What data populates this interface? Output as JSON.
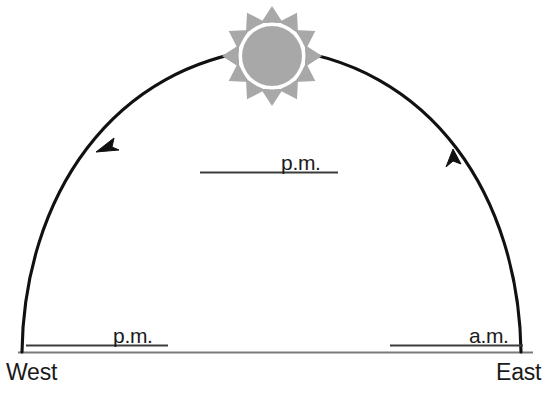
{
  "diagram": {
    "type": "sun-path-arc",
    "background_color": "#ffffff",
    "arc_color": "#111111",
    "horizon_color": "#777777",
    "rule_color": "#444444",
    "sun": {
      "icon": "sun-icon",
      "disc_color": "#a8a8a8",
      "ray_color": "#a8a8a8",
      "ring_color": "#ffffff",
      "ray_count": 12,
      "center_x": 272,
      "center_y": 56,
      "disc_radius": 30,
      "ray_outer_radius": 48
    },
    "arc": {
      "left_end_x": 22,
      "left_end_y": 352,
      "right_end_x": 521,
      "right_end_y": 352,
      "apex_x": 272,
      "apex_y": 48,
      "direction": "east-to-west",
      "arrowheads": [
        {
          "name": "arrow-descending-west",
          "x": 100,
          "y": 147,
          "points": "down-left"
        },
        {
          "name": "arrow-ascending-east",
          "x": 455,
          "y": 155,
          "points": "up-left"
        }
      ]
    },
    "horizon": {
      "x_start": 18,
      "x_end": 533,
      "y": 352
    },
    "labels": {
      "pm_upper": {
        "text": "p.m.",
        "rule_x1": 200,
        "rule_x2": 338,
        "rule_y": 172
      },
      "pm_lower": {
        "text": "p.m.",
        "rule_x1": 26,
        "rule_x2": 168,
        "rule_y": 345
      },
      "am_lower": {
        "text": "a.m.",
        "rule_x1": 390,
        "rule_x2": 523,
        "rule_y": 345
      },
      "west": {
        "text": "West"
      },
      "east": {
        "text": "East"
      }
    }
  }
}
